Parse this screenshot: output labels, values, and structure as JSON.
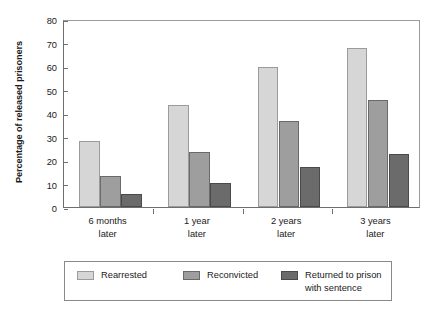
{
  "chart_data": {
    "type": "bar",
    "title": "",
    "subtitle": "",
    "xlabel": "",
    "ylabel": "Percentage of released prisoners",
    "ylim": [
      0,
      80
    ],
    "yticks": [
      0,
      10,
      20,
      30,
      40,
      50,
      60,
      70,
      80
    ],
    "ytick_labels": [
      "0",
      "10",
      "20",
      "30",
      "40",
      "50",
      "60",
      "70",
      "80"
    ],
    "grid": false,
    "legend_position": "bottom",
    "categories": [
      "6 months\nlater",
      "1 year\nlater",
      "2 years\nlater",
      "3 years\nlater"
    ],
    "category_lines": [
      [
        "6 months",
        "later"
      ],
      [
        "1 year",
        "later"
      ],
      [
        "2 years",
        "later"
      ],
      [
        "3 years",
        "later"
      ]
    ],
    "series": [
      {
        "name": "Rearrested",
        "color": "#d6d6d6",
        "values": [
          28.3,
          43.3,
          59.5,
          67.8
        ]
      },
      {
        "name": "Reconvicted",
        "color": "#9e9e9e",
        "values": [
          13.0,
          23.2,
          36.6,
          45.4
        ]
      },
      {
        "name": "Returned to prison\nwith sentence",
        "color": "#6b6b6b",
        "values": [
          5.5,
          10.4,
          17.2,
          22.5
        ]
      }
    ]
  },
  "legend": {
    "entries": [
      {
        "label": "Rearrested",
        "swatch": "legend-swatch-rearrested"
      },
      {
        "label": "Reconvicted",
        "swatch": "legend-swatch-reconvicted"
      },
      {
        "label": "Returned to prison\nwith sentence",
        "swatch": "legend-swatch-returned-to-prison"
      }
    ]
  },
  "colors": {
    "series_light": "#d6d6d6",
    "series_medium": "#9e9e9e",
    "series_dark": "#6b6b6b",
    "axis": "#6e6e6e",
    "background": "#ffffff"
  }
}
